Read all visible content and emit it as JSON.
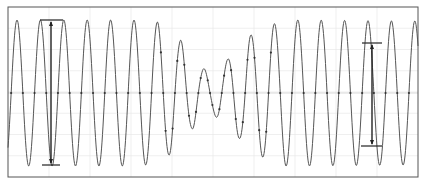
{
  "chart_data": {
    "type": "line",
    "title": "",
    "xlabel": "",
    "ylabel": "",
    "grid": true,
    "legend": "none",
    "frame": {
      "x0": 8,
      "y0": 7,
      "x1": 418,
      "y1": 177
    },
    "baseline_y": 93,
    "period_px": 23.4,
    "phase_first_peak_x": 17,
    "full_amplitude_px": 73,
    "envelope": [
      {
        "x": 8,
        "amp": 73
      },
      {
        "x": 134,
        "amp": 73
      },
      {
        "x": 157,
        "amp": 71
      },
      {
        "x": 170,
        "amp": 62
      },
      {
        "x": 180,
        "amp": 53
      },
      {
        "x": 192,
        "amp": 36
      },
      {
        "x": 202,
        "amp": 25
      },
      {
        "x": 211,
        "amp": 20
      },
      {
        "x": 221,
        "amp": 28
      },
      {
        "x": 238,
        "amp": 45
      },
      {
        "x": 250,
        "amp": 58
      },
      {
        "x": 262,
        "amp": 64
      },
      {
        "x": 272,
        "amp": 69
      },
      {
        "x": 286,
        "amp": 73
      },
      {
        "x": 418,
        "amp": 72
      }
    ],
    "series": [
      {
        "name": "signal",
        "color": "#555555",
        "marker_color": "#333333"
      }
    ],
    "markers": [
      {
        "name": "measure-1",
        "x": 51,
        "y_top": 20,
        "y_bottom": 165,
        "top_bar": [
          40,
          63
        ],
        "bottom_bar": [
          42,
          60
        ]
      },
      {
        "name": "measure-2",
        "x": 372,
        "y_top": 43,
        "y_bottom": 146,
        "top_bar": [
          362,
          382
        ],
        "bottom_bar": [
          361,
          382
        ]
      }
    ]
  },
  "colors": {
    "background": "#ffffff",
    "frame": "#555555",
    "grid": "#e4e4e4",
    "trace": "#555555",
    "marker": "#222222"
  }
}
